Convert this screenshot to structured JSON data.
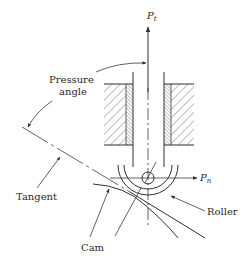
{
  "figure": {
    "labels": {
      "pressure_angle_line1": "Pressure",
      "pressure_angle_line2": "angle",
      "tangent": "Tangent",
      "cam": "Cam",
      "roller": "Roller"
    },
    "forces": {
      "tangential": {
        "symbol": "P",
        "subscript": "t"
      },
      "normal": {
        "symbol": "P",
        "subscript": "n"
      }
    },
    "colors": {
      "stroke": "#2f2f2f",
      "background": "#ffffff"
    }
  }
}
